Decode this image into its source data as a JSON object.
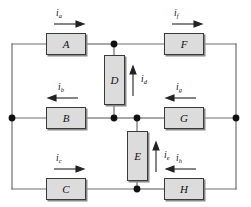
{
  "diagram": {
    "type": "electrical-circuit",
    "colors": {
      "wire": "#6e6e6e",
      "node": "#111111",
      "box_fill": "#dcdcdc",
      "box_border": "#3a3a3a",
      "box_shadow": "#8a8a8a",
      "text": "#111111",
      "background": "#ffffff"
    },
    "elements": [
      {
        "id": "A",
        "label": "A",
        "orientation": "horizontal",
        "x": 46,
        "y": 33,
        "w": 40,
        "h": 22
      },
      {
        "id": "F",
        "label": "F",
        "orientation": "horizontal",
        "x": 164,
        "y": 33,
        "w": 40,
        "h": 22
      },
      {
        "id": "B",
        "label": "B",
        "orientation": "horizontal",
        "x": 46,
        "y": 107,
        "w": 40,
        "h": 22
      },
      {
        "id": "G",
        "label": "G",
        "orientation": "horizontal",
        "x": 164,
        "y": 107,
        "w": 40,
        "h": 22
      },
      {
        "id": "C",
        "label": "C",
        "orientation": "horizontal",
        "x": 46,
        "y": 178,
        "w": 40,
        "h": 22
      },
      {
        "id": "H",
        "label": "H",
        "orientation": "horizontal",
        "x": 164,
        "y": 178,
        "w": 40,
        "h": 22
      },
      {
        "id": "D",
        "label": "D",
        "orientation": "vertical",
        "x": 104,
        "y": 55,
        "w": 21,
        "h": 50
      },
      {
        "id": "E",
        "label": "E",
        "orientation": "vertical",
        "x": 127,
        "y": 131,
        "w": 21,
        "h": 50
      }
    ],
    "currents": [
      {
        "id": "i_a",
        "symbol": "i",
        "subscript": "a",
        "element": "A",
        "direction": "right",
        "x": 56,
        "y": 14
      },
      {
        "id": "i_f",
        "symbol": "i",
        "subscript": "f",
        "element": "F",
        "direction": "right",
        "x": 174,
        "y": 14
      },
      {
        "id": "i_b",
        "symbol": "i",
        "subscript": "b",
        "element": "B",
        "direction": "left",
        "x": 56,
        "y": 88
      },
      {
        "id": "i_g",
        "symbol": "i",
        "subscript": "g",
        "element": "G",
        "direction": "left",
        "x": 174,
        "y": 88
      },
      {
        "id": "i_c",
        "symbol": "i",
        "subscript": "c",
        "element": "C",
        "direction": "right",
        "x": 56,
        "y": 159
      },
      {
        "id": "i_h",
        "symbol": "i",
        "subscript": "h",
        "element": "H",
        "direction": "left",
        "x": 174,
        "y": 159
      },
      {
        "id": "i_d",
        "symbol": "i",
        "subscript": "d",
        "element": "D",
        "direction": "up",
        "x": 141,
        "y": 76
      },
      {
        "id": "i_e",
        "symbol": "i",
        "subscript": "e",
        "element": "E",
        "direction": "up",
        "x": 163,
        "y": 152
      }
    ],
    "nodes": [
      {
        "id": "node-left-mid",
        "x": 12,
        "y": 118
      },
      {
        "id": "node-right-mid",
        "x": 236,
        "y": 118
      },
      {
        "id": "node-top-center",
        "x": 114,
        "y": 44
      },
      {
        "id": "node-mid-d",
        "x": 114,
        "y": 118
      },
      {
        "id": "node-mid-e",
        "x": 137,
        "y": 118
      },
      {
        "id": "node-bottom-center",
        "x": 137,
        "y": 189
      }
    ],
    "rails": {
      "top_y": 44,
      "middle_y": 118,
      "bottom_y": 189,
      "left_x": 12,
      "right_x": 236
    }
  }
}
